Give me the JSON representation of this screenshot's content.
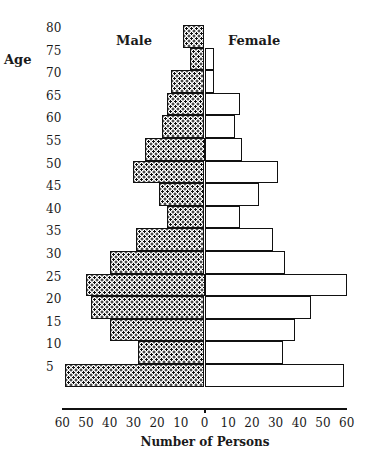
{
  "chart_data": {
    "type": "bar",
    "subtype": "population-pyramid",
    "title": "",
    "xlabel": "Number of Persons",
    "ylabel": "Age",
    "legend": [
      "Male",
      "Female"
    ],
    "categories": [
      "80",
      "75",
      "70",
      "65",
      "60",
      "55",
      "50",
      "45",
      "40",
      "35",
      "30",
      "25",
      "20",
      "15",
      "10",
      "5"
    ],
    "series": [
      {
        "name": "Male",
        "values": [
          9,
          6,
          14,
          16,
          18,
          25,
          30,
          19,
          16,
          29,
          40,
          50,
          48,
          40,
          28,
          59
        ]
      },
      {
        "name": "Female",
        "values": [
          0,
          4,
          4,
          15,
          13,
          16,
          31,
          23,
          15,
          29,
          34,
          60,
          45,
          38,
          33,
          59
        ]
      }
    ],
    "x_ticks": [
      "60",
      "50",
      "40",
      "30",
      "20",
      "10",
      "0",
      "10",
      "20",
      "30",
      "40",
      "50",
      "60"
    ],
    "xlim": [
      -60,
      60
    ],
    "grid": false
  },
  "labels": {
    "age": "Age",
    "male": "Male",
    "female": "Female",
    "xlabel": "Number of Persons"
  },
  "colors": {
    "outline": "#111111",
    "male_fill": "stippled black on white",
    "female_fill": "#ffffff"
  }
}
